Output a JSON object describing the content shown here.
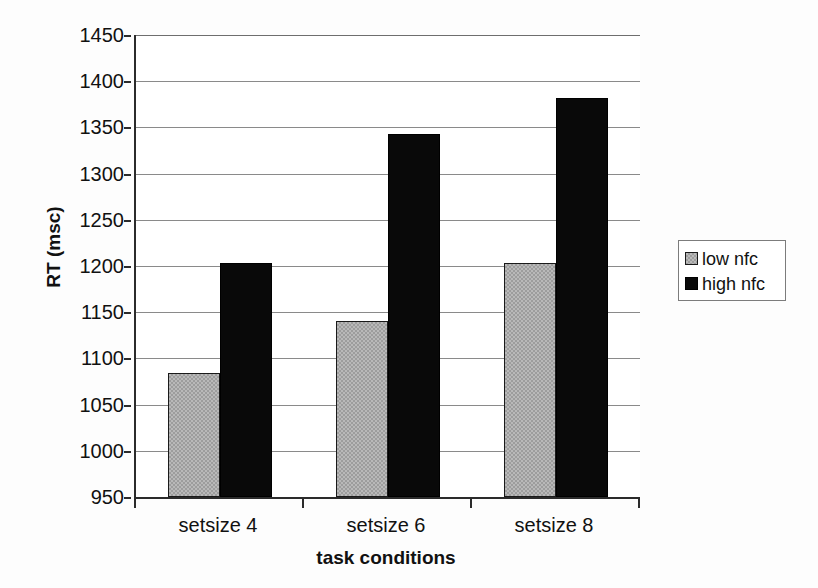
{
  "chart_data": {
    "type": "bar",
    "title": "",
    "subtitle": "",
    "xlabel": "task conditions",
    "ylabel": "RT (msc)",
    "categories": [
      "setsize 4",
      "setsize 6",
      "setsize 8"
    ],
    "series": [
      {
        "name": "low nfc",
        "color": "#b9b9b9",
        "values": [
          1084,
          1141,
          1203
        ]
      },
      {
        "name": "high nfc",
        "color": "#090909",
        "values": [
          1203,
          1343,
          1382
        ]
      }
    ],
    "ylim": [
      950,
      1450
    ],
    "ytick_step": 50,
    "yticks": [
      1450,
      1400,
      1350,
      1300,
      1250,
      1200,
      1150,
      1100,
      1050,
      1000,
      950
    ],
    "grid": true,
    "legend_position": "right",
    "legend_entries": [
      "low nfc",
      "high nfc"
    ]
  }
}
